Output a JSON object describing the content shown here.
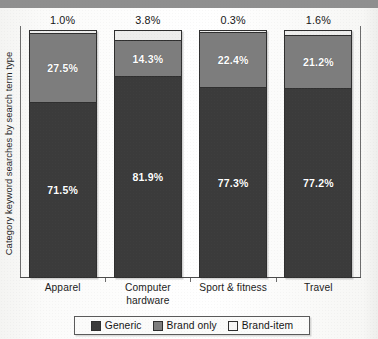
{
  "chart_data": {
    "type": "bar",
    "subtype": "stacked-100-percent",
    "title": "",
    "xlabel": "",
    "ylabel": "Category keyword searches by search term type",
    "ylim": [
      0,
      100
    ],
    "grid": false,
    "legend_position": "bottom",
    "categories": [
      "Apparel",
      "Computer hardware",
      "Sport & fitness",
      "Travel"
    ],
    "series": [
      {
        "name": "Generic",
        "color": "#3b3b3b",
        "values": [
          71.5,
          81.9,
          77.3,
          77.2
        ]
      },
      {
        "name": "Brand only",
        "color": "#7d7d7d",
        "values": [
          27.5,
          14.3,
          22.4,
          21.2
        ]
      },
      {
        "name": "Brand-item",
        "color": "#ededec",
        "values": [
          1.0,
          3.8,
          0.3,
          1.6
        ]
      }
    ],
    "value_labels": {
      "generic": [
        "71.5%",
        "81.9%",
        "77.3%",
        "77.2%"
      ],
      "brand_only": [
        "27.5%",
        "14.3%",
        "22.4%",
        "21.2%"
      ],
      "brand_item": [
        "1.0%",
        "3.8%",
        "0.3%",
        "1.6%"
      ]
    }
  },
  "axis": {
    "y_title": "Category keyword searches by search term type",
    "categories": [
      {
        "line1": "Apparel",
        "line2": ""
      },
      {
        "line1": "Computer",
        "line2": "hardware"
      },
      {
        "line1": "Sport & fitness",
        "line2": ""
      },
      {
        "line1": "Travel",
        "line2": ""
      }
    ]
  },
  "bars": [
    {
      "category": "Apparel",
      "top_label": "1.0%",
      "segments": [
        {
          "series": "Brand-item",
          "label": "",
          "value": 1.0,
          "show_label": false
        },
        {
          "series": "Brand only",
          "label": "27.5%",
          "value": 27.5,
          "show_label": true
        },
        {
          "series": "Generic",
          "label": "71.5%",
          "value": 71.5,
          "show_label": true
        }
      ]
    },
    {
      "category": "Computer hardware",
      "top_label": "3.8%",
      "segments": [
        {
          "series": "Brand-item",
          "label": "",
          "value": 3.8,
          "show_label": false
        },
        {
          "series": "Brand only",
          "label": "14.3%",
          "value": 14.3,
          "show_label": true
        },
        {
          "series": "Generic",
          "label": "81.9%",
          "value": 81.9,
          "show_label": true
        }
      ]
    },
    {
      "category": "Sport & fitness",
      "top_label": "0.3%",
      "segments": [
        {
          "series": "Brand-item",
          "label": "",
          "value": 0.3,
          "show_label": false
        },
        {
          "series": "Brand only",
          "label": "22.4%",
          "value": 22.4,
          "show_label": true
        },
        {
          "series": "Generic",
          "label": "77.3%",
          "value": 77.3,
          "show_label": true
        }
      ]
    },
    {
      "category": "Travel",
      "top_label": "1.6%",
      "segments": [
        {
          "series": "Brand-item",
          "label": "",
          "value": 1.6,
          "show_label": false
        },
        {
          "series": "Brand only",
          "label": "21.2%",
          "value": 21.2,
          "show_label": true
        },
        {
          "series": "Generic",
          "label": "77.2%",
          "value": 77.2,
          "show_label": true
        }
      ]
    }
  ],
  "legend": {
    "items": [
      {
        "label": "Generic",
        "color": "#3b3b3b"
      },
      {
        "label": "Brand only",
        "color": "#7d7d7d"
      },
      {
        "label": "Brand-item",
        "color": "#f6f6f5"
      }
    ]
  },
  "title_band": {
    "cut_off_text": ""
  }
}
